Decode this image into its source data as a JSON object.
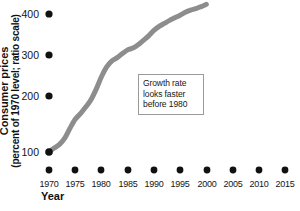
{
  "chart_data": {
    "type": "line",
    "title": "",
    "subtitle": "",
    "xlabel": "Year",
    "ylabel": "Consumer prices (percent of 1970 level; ratio scale)",
    "ylabel_line1": "Consumer prices",
    "ylabel_line2": "(percent of 1970 level; ratio scale)",
    "xlim": [
      1970,
      2015
    ],
    "ylim": [
      100,
      430
    ],
    "yscale": "log",
    "grid": false,
    "legend": null,
    "xticks": [
      1970,
      1975,
      1980,
      1985,
      1990,
      1995,
      2000,
      2005,
      2010,
      2015
    ],
    "xtick_labels": [
      "1970",
      "1975",
      "1980",
      "1985",
      "1990",
      "1995",
      "2000",
      "2005",
      "2010",
      "2015"
    ],
    "yticks": [
      100,
      200,
      300,
      400
    ],
    "ytick_labels": [
      "100",
      "200",
      "300",
      "400"
    ],
    "tick_marker": "filled-circle",
    "line_color": "#8d8d8d",
    "line_width_px": 5,
    "series": [
      {
        "name": "Consumer prices",
        "x": [
          1970,
          1971,
          1972,
          1973,
          1974,
          1975,
          1976,
          1977,
          1978,
          1979,
          1980,
          1981,
          1982,
          1983,
          1984,
          1985,
          1986,
          1987,
          1988,
          1989,
          1990,
          1991,
          1992,
          1993,
          1994,
          1995,
          1996,
          1997,
          1998,
          1999,
          2000
        ],
        "y": [
          100,
          104,
          108,
          115,
          127,
          139,
          147,
          157,
          169,
          188,
          213,
          235,
          250,
          258,
          269,
          279,
          284,
          294,
          307,
          321,
          339,
          353,
          364,
          375,
          385,
          395,
          407,
          416,
          422,
          431,
          441
        ]
      }
    ],
    "annotations": [
      {
        "text": "Growth rate looks faster before 1980",
        "lines": [
          "Growth rate",
          "looks faster",
          "before 1980"
        ],
        "x_px": 138,
        "y_px": 74,
        "box": true
      }
    ]
  },
  "axes": {
    "y_title_line1": "Consumer prices",
    "y_title_line2": "(percent of 1970 level; ratio scale)",
    "x_title": "Year",
    "y_tick_labels": [
      "400",
      "300",
      "200",
      "100"
    ],
    "x_tick_labels": [
      "1970",
      "1975",
      "1980",
      "1985",
      "1990",
      "1995",
      "2000",
      "2005",
      "2010",
      "2015"
    ]
  },
  "annotation": {
    "line1": "Growth rate",
    "line2": "looks faster",
    "line3": "before 1980"
  },
  "colors": {
    "line": "#8d8d8d",
    "tick_dot": "#111111",
    "annotation_border": "#9a9a9a",
    "background": "#ffffff",
    "text": "#151515"
  }
}
